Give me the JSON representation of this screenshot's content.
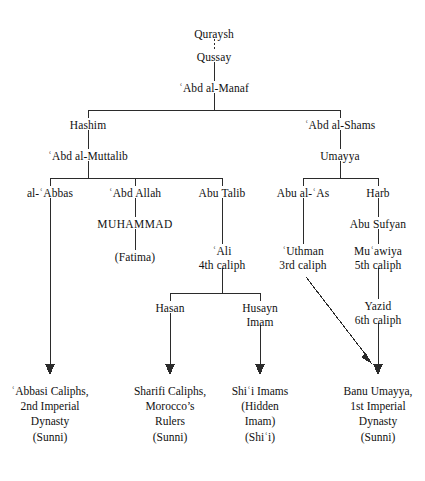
{
  "diagram": {
    "line_color": "#2b2b2b",
    "text_color": "#111111",
    "background": "#ffffff",
    "nodes": {
      "quraysh": {
        "label": "Quraysh",
        "x": 214,
        "y": 34
      },
      "qussay": {
        "label": "Qussay",
        "x": 214,
        "y": 57
      },
      "abd_al_manaf": {
        "label": "ʿAbd al-Manaf",
        "x": 214,
        "y": 88
      },
      "hashim": {
        "label": "Hashim",
        "x": 88,
        "y": 125
      },
      "abd_al_shams": {
        "label": "ʿAbd al-Shams",
        "x": 340,
        "y": 125
      },
      "abd_al_muttalib": {
        "label": "ʿAbd al-Muttalib",
        "x": 88,
        "y": 156
      },
      "umayya": {
        "label": "Umayya",
        "x": 340,
        "y": 156
      },
      "al_abbas": {
        "label": "al-ʿAbbas",
        "x": 50,
        "y": 193
      },
      "abd_allah": {
        "label": "ʿAbd Allah",
        "x": 135,
        "y": 193
      },
      "abu_talib": {
        "label": "Abu Talib",
        "x": 222,
        "y": 193
      },
      "abu_al_as": {
        "label": "Abu al-ʿAs",
        "x": 303,
        "y": 193
      },
      "harb": {
        "label": "Harb",
        "x": 378,
        "y": 193
      },
      "muhammad": {
        "label": "MUHAMMAD",
        "x": 135,
        "y": 224
      },
      "abu_sufyan": {
        "label": "Abu Sufyan",
        "x": 378,
        "y": 224
      },
      "fatima": {
        "label": "(Fatima)",
        "x": 135,
        "y": 257
      },
      "ali": {
        "line1": "ʿAli",
        "line2": "4th caliph",
        "x": 222,
        "y": 251
      },
      "uthman": {
        "line1": "ʿUthman",
        "line2": "3rd caliph",
        "x": 303,
        "y": 251
      },
      "muawiya": {
        "line1": "Muʿawiya",
        "line2": "5th caliph",
        "x": 378,
        "y": 251
      },
      "yazid": {
        "line1": "Yazid",
        "line2": "6th caliph",
        "x": 378,
        "y": 306
      },
      "hasan": {
        "label": "Hasan",
        "x": 170,
        "y": 308
      },
      "husayn": {
        "line1": "Husayn",
        "line2": "Imam",
        "x": 260,
        "y": 308
      }
    },
    "leaves": [
      {
        "name": "abbasi-caliphs",
        "x": 50,
        "y": 391,
        "lines": [
          "ʿAbbasi Caliphs,",
          "2nd Imperial",
          "Dynasty",
          "(Sunni)"
        ]
      },
      {
        "name": "sharifi-caliphs",
        "x": 170,
        "y": 391,
        "lines": [
          "Sharifi Caliphs,",
          "Morocco’s",
          "Rulers",
          "(Sunni)"
        ]
      },
      {
        "name": "shii-imams",
        "x": 260,
        "y": 391,
        "lines": [
          "Shiʿi Imams",
          "(Hidden",
          "Imam)",
          "(Shiʿi)"
        ]
      },
      {
        "name": "banu-umayya",
        "x": 378,
        "y": 391,
        "lines": [
          "Banu Umayya,",
          "1st Imperial",
          "Dynasty",
          "(Sunni)"
        ]
      }
    ]
  }
}
